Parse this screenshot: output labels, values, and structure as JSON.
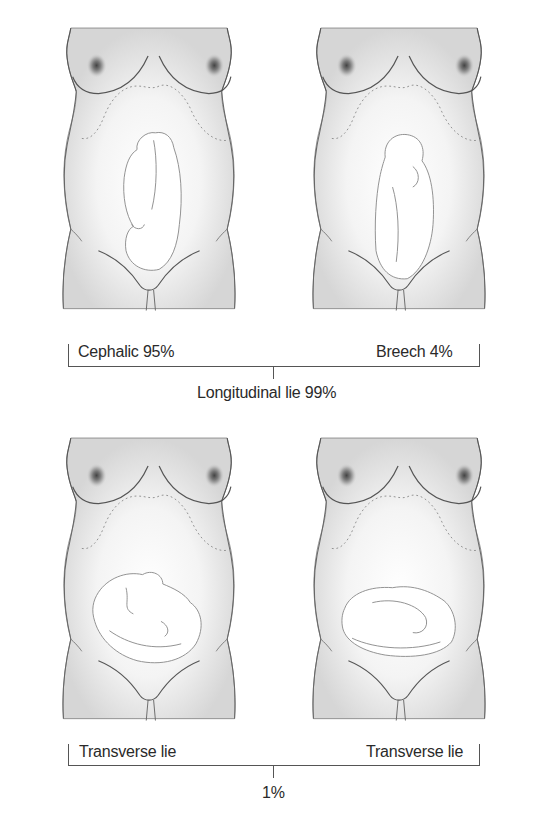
{
  "figures": [
    {
      "id": "cephalic",
      "label": "Cephalic 95%",
      "position": "top-left",
      "fetus": "vertical-head-down"
    },
    {
      "id": "breech",
      "label": "Breech 4%",
      "position": "top-right",
      "fetus": "vertical-head-up"
    },
    {
      "id": "transverse-left",
      "label": "Transverse lie",
      "position": "bottom-left",
      "fetus": "horizontal"
    },
    {
      "id": "transverse-right",
      "label": "Transverse lie",
      "position": "bottom-right",
      "fetus": "horizontal"
    }
  ],
  "groups": {
    "top": {
      "label": "Longitudinal lie 99%"
    },
    "bottom": {
      "label": "1%"
    }
  },
  "colors": {
    "outline": "#555555",
    "skin_shade": "#d9d9d9",
    "text": "#2a2a2a"
  }
}
